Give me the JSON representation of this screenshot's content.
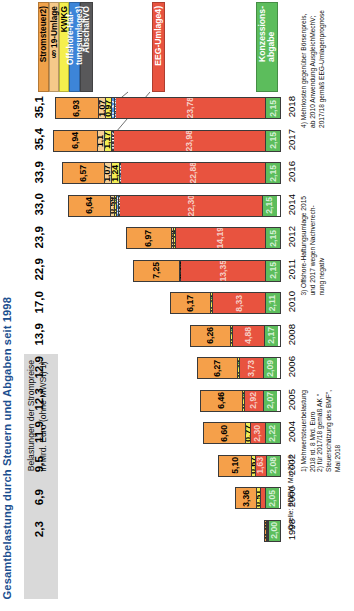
{
  "title": "Gesamtbelastung durch Steuern und Abgaben seit 1998",
  "subtitle": "Belastungen der Strompreise\nin Mrd. Euro (ohne MWSt) 1)",
  "subtitle_line1": "Belastungen der Strompreise",
  "subtitle_line2": "in Mrd. Euro (ohne MWSt) 1)",
  "colors": {
    "title": "#1c4f8f",
    "stromsteuer": "#f5a04a",
    "paragraph19": "#f7cf94",
    "kwkg": "#f3ee55",
    "offshore": "#4a8fdd",
    "abschaltvo": "#58585a",
    "eeg": "#e8533f",
    "konzession": "#5cbd5c",
    "subtitle_bg": "#d9d9d9"
  },
  "legend": {
    "items": [
      {
        "label": "Stromsteuer2)",
        "key": "stromsteuer"
      },
      {
        "label": "§ 19-Umlage",
        "key": "paragraph19"
      },
      {
        "label": "KWKG",
        "key": "kwkg"
      },
      {
        "label": "Offshore-Haf-\ntungsumlage3)",
        "key": "offshore"
      },
      {
        "label": "AbschaltVO",
        "key": "abschaltvo"
      }
    ],
    "offshore_line1": "Offshore-Haf-",
    "offshore_line2": "tungsumlage3)",
    "eeg_label": "EEG-Umlage4)",
    "konzession_line1": "Konzessions-",
    "konzession_line2": "abgabe"
  },
  "footnotes": {
    "f1_line1": "1)  Mehrwertsteuerbelastung",
    "f1_line2": "2018 rd. 8 Mrd. Euro",
    "f2_line1": "2)  für 2017/18 gemäß AK \"",
    "f2_line2": "Steuerschätzung des BMF\",",
    "f2_line3": "Mai 2018",
    "f3_line1": "3)  Offshore-Haftungsumlage 2015",
    "f3_line2": "und 2017 wegen Nachverrech-",
    "f3_line3": "nung negativ",
    "f4_line1": "4)  Mehrkosten gegenüber Börsenpreis,",
    "f4_line2": "ab 2010 Anwendung AusgleichMechV;",
    "f4_line3": "2017/18 gemäß EEG-Umlagenprognose",
    "source": "Quelle: BDEW, Mai 2018"
  },
  "chart_data": {
    "type": "bar",
    "title": "Gesamtbelastung durch Steuern und Abgaben seit 1998",
    "subtitle": "Belastungen der Strompreise in Mrd. Euro (ohne MWSt)",
    "orientation": "horizontal-stacked",
    "xlabel": "",
    "ylabel": "Mrd. Euro",
    "xlim": [
      0,
      35.5
    ],
    "grid": false,
    "legend_position": "top",
    "categories": [
      "2018",
      "2017",
      "2016",
      "2014",
      "2012",
      "2011",
      "2010",
      "2008",
      "2006",
      "2005",
      "2004",
      "2002",
      "2000",
      "1998"
    ],
    "totals": [
      "35,1",
      "35,4",
      "33,9",
      "33,0",
      "23,9",
      "22,9",
      "17,0",
      "13,9",
      "12,9",
      "12,3",
      "11,9",
      "9,5",
      "6,9",
      "2,3"
    ],
    "totals_numeric": [
      35.1,
      35.4,
      33.9,
      33.0,
      23.9,
      22.9,
      17.0,
      13.9,
      12.9,
      12.3,
      11.9,
      9.5,
      6.9,
      2.3
    ],
    "series": [
      {
        "name": "Stromsteuer2)",
        "key": "stromsteuer",
        "values": [
          6.93,
          6.94,
          6.57,
          6.64,
          6.97,
          7.25,
          6.17,
          6.26,
          6.27,
          6.46,
          6.6,
          5.1,
          3.36,
          0.2
        ],
        "labels": [
          "6,93",
          "6,94",
          "6,57",
          "6,64",
          "6,97",
          "7,25",
          "6,17",
          "6,26",
          "6,27",
          "6,46",
          "6,60",
          "5,10",
          "3,36",
          "0,20"
        ]
      },
      {
        "name": "§ 19-Umlage",
        "key": "paragraph19",
        "values": [
          1.07,
          1.1,
          1.07,
          0.59,
          0.44,
          0.0,
          0.0,
          0.0,
          0.0,
          0.0,
          0.0,
          0.0,
          0.0,
          0.0
        ],
        "labels": [
          "1,07",
          "1,1",
          "1,07",
          "0,59",
          "0,44",
          "",
          "",
          "",
          "",
          "",
          "",
          "",
          "",
          ""
        ]
      },
      {
        "name": "KWKG",
        "key": "kwkg",
        "values": [
          0.97,
          1.17,
          1.24,
          0.35,
          0.19,
          0.15,
          0.35,
          0.35,
          0.35,
          0.35,
          0.77,
          0.67,
          0.51,
          0.05
        ],
        "labels": [
          "0,97",
          "1,17",
          "1,24",
          "0,35",
          "0,19",
          "0,15",
          "0,35",
          "0,35",
          "0,35",
          "0,35",
          "0,77",
          "0,67",
          "0,51",
          ""
        ]
      },
      {
        "name": "Offshore-Haftungsumlage3)",
        "key": "offshore",
        "values": [
          0.37,
          0.03,
          0.16,
          0.26,
          0.0,
          0.0,
          0.0,
          0.0,
          0.0,
          0.0,
          0.0,
          0.0,
          0.0,
          0.0
        ],
        "labels": [
          "0,37",
          "0,03",
          "0,16",
          "0,26",
          "",
          "",
          "",
          "",
          "",
          "",
          "",
          "",
          "",
          ""
        ]
      },
      {
        "name": "AbschaltVO",
        "key": "abschaltvo",
        "values": [
          0.053,
          0.01,
          0.0,
          0.05,
          0.0,
          0.0,
          0.0,
          0.0,
          0.0,
          0.0,
          0.0,
          0.0,
          0.0,
          0.0
        ],
        "labels": [
          "0,053",
          "0,01",
          "",
          "0,05",
          "",
          "",
          "",
          "",
          "",
          "",
          "",
          "",
          "",
          ""
        ]
      },
      {
        "name": "EEG-Umlage4)",
        "key": "eeg",
        "values": [
          23.78,
          23.98,
          22.88,
          22.3,
          14.19,
          13.35,
          8.33,
          4.88,
          3.73,
          2.92,
          2.3,
          1.63,
          0.8,
          0.07
        ],
        "labels": [
          "23,78",
          "23,98",
          "22,88",
          "22,30",
          "14,19",
          "13,35",
          "8,33",
          "4,88",
          "3,73",
          "2,92",
          "2,30",
          "1,63",
          "",
          ""
        ]
      },
      {
        "name": "Konzessionsabgabe",
        "key": "konzession",
        "values": [
          2.15,
          2.15,
          2.15,
          2.15,
          2.15,
          2.15,
          2.11,
          2.17,
          2.09,
          2.07,
          2.22,
          2.08,
          2.05,
          2.0
        ],
        "labels": [
          "2,15",
          "2,15",
          "2,15",
          "2,15",
          "2,15",
          "2,15",
          "2,11",
          "2,17",
          "2,09",
          "2,07",
          "2,22",
          "2,08",
          "2,05",
          "2,00"
        ]
      }
    ]
  }
}
